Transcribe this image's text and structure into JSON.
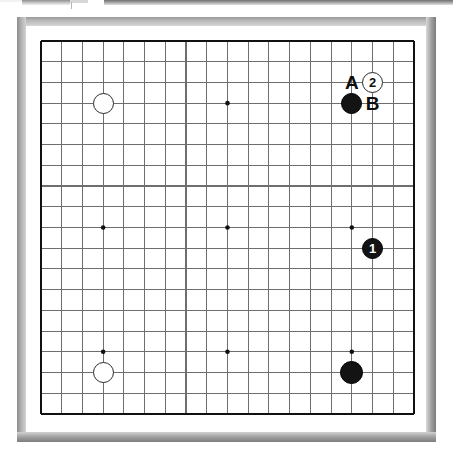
{
  "app": {
    "title": "Go Board Diagram",
    "board_label": "goban-19x19"
  },
  "top_strip": {
    "note": "cropped-ui-fragment"
  },
  "board": {
    "size": 19,
    "origin_x": 41,
    "origin_y": 41,
    "spacing": 20.72,
    "line_color": "#6e6e6e",
    "edge_color": "#111111",
    "surface_color": "#ffffff",
    "frame_color": "#b0b0b0",
    "star_points": [
      {
        "col": 3,
        "row": 3
      },
      {
        "col": 9,
        "row": 3
      },
      {
        "col": 15,
        "row": 3
      },
      {
        "col": 3,
        "row": 9
      },
      {
        "col": 9,
        "row": 9
      },
      {
        "col": 15,
        "row": 9
      },
      {
        "col": 3,
        "row": 15
      },
      {
        "col": 9,
        "row": 15
      },
      {
        "col": 15,
        "row": 15
      }
    ]
  },
  "stones": [
    {
      "id": "w-upper-left",
      "color": "white",
      "col": 3,
      "row": 3,
      "label": "",
      "radius": 10.5
    },
    {
      "id": "w-lower-left",
      "color": "white",
      "col": 3,
      "row": 16,
      "label": "",
      "radius": 10.5
    },
    {
      "id": "b-move-2-mark",
      "color": "white",
      "col": 16,
      "row": 2,
      "label": "2",
      "radius": 10.5
    },
    {
      "id": "b-upper-right",
      "color": "black",
      "col": 15,
      "row": 3,
      "label": "",
      "radius": 10.5
    },
    {
      "id": "b-move-1",
      "color": "black",
      "col": 16,
      "row": 10,
      "label": "1",
      "radius": 10.5
    },
    {
      "id": "b-lower-right",
      "color": "black",
      "col": 15,
      "row": 16,
      "label": "",
      "radius": 11.5
    }
  ],
  "markers": [
    {
      "id": "marker-a",
      "text": "A",
      "col": 15,
      "row": 2
    },
    {
      "id": "marker-b",
      "text": "B",
      "col": 16,
      "row": 3
    }
  ]
}
